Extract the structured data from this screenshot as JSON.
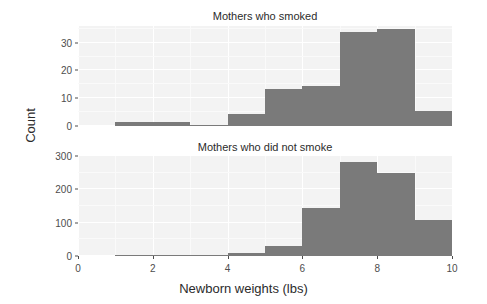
{
  "chart_data": {
    "type": "bar",
    "title": "",
    "subtitle": "",
    "xlabel": "Newborn weights (lbs)",
    "ylabel": "Count",
    "grid": true,
    "legend": "none",
    "xlim": [
      0,
      10
    ],
    "x_ticks": [
      "0",
      "2",
      "4",
      "6",
      "8",
      "10"
    ],
    "x_tick_values": [
      0,
      2,
      4,
      6,
      8,
      10
    ],
    "facets": [
      {
        "name": "smoked",
        "title": "Mothers who smoked",
        "ylim": [
          0,
          36
        ],
        "y_ticks": [
          "0",
          "10",
          "20",
          "30"
        ],
        "y_tick_values": [
          0,
          10,
          20,
          30
        ],
        "bin_width": 1,
        "bins": [
          {
            "x0": 1,
            "x1": 2,
            "value": 1.5
          },
          {
            "x0": 2,
            "x1": 3,
            "value": 1.5
          },
          {
            "x0": 3,
            "x1": 4,
            "value": 0.5
          },
          {
            "x0": 4,
            "x1": 5,
            "value": 4.5
          },
          {
            "x0": 5,
            "x1": 6,
            "value": 13.5
          },
          {
            "x0": 6,
            "x1": 7,
            "value": 14.5
          },
          {
            "x0": 7,
            "x1": 8,
            "value": 34
          },
          {
            "x0": 8,
            "x1": 9,
            "value": 35
          },
          {
            "x0": 9,
            "x1": 10,
            "value": 5.5
          }
        ]
      },
      {
        "name": "did-not-smoke",
        "title": "Mothers who did not smoke",
        "ylim": [
          0,
          300
        ],
        "y_ticks": [
          "0",
          "100",
          "200",
          "300"
        ],
        "y_tick_values": [
          0,
          100,
          200,
          300
        ],
        "bin_width": 1,
        "bins": [
          {
            "x0": 1,
            "x1": 2,
            "value": 1
          },
          {
            "x0": 2,
            "x1": 3,
            "value": 2
          },
          {
            "x0": 3,
            "x1": 4,
            "value": 1
          },
          {
            "x0": 4,
            "x1": 5,
            "value": 8
          },
          {
            "x0": 5,
            "x1": 6,
            "value": 31
          },
          {
            "x0": 6,
            "x1": 7,
            "value": 143
          },
          {
            "x0": 7,
            "x1": 8,
            "value": 282
          },
          {
            "x0": 8,
            "x1": 9,
            "value": 248
          },
          {
            "x0": 9,
            "x1": 10,
            "value": 107
          }
        ]
      }
    ],
    "colors": {
      "bar": "#7a7a7a",
      "panel_background": "#f3f3f3",
      "grid": "#ffffff",
      "text": "#2b2b2b",
      "tick_text": "#4d4d4d"
    }
  }
}
